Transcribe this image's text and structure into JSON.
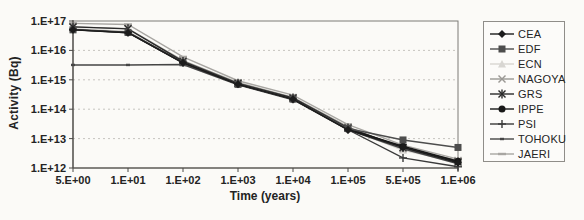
{
  "chart_data": {
    "type": "line",
    "title": "",
    "xlabel": "Time (years)",
    "ylabel": "Activity (Bq)",
    "x_axis_type": "category",
    "y_axis_type": "log",
    "ylim": [
      1000000000000.0,
      1e+17
    ],
    "grid": "horizontal-dashed",
    "legend_position": "right",
    "categories": [
      "5.E+00",
      "1.E+01",
      "1.E+02",
      "1.E+03",
      "1.E+04",
      "1.E+05",
      "5.E+05",
      "1.E+06"
    ],
    "y_tick_labels": [
      "1.E+17",
      "1.E+16",
      "1.E+15",
      "1.E+14",
      "1.E+13",
      "1.E+12"
    ],
    "series": [
      {
        "name": "JAERI",
        "marker": "dash",
        "color": "#a8a6a2",
        "values": [
          8.3e+16,
          7.6e+16,
          6000000000000000.0,
          930000000000000.0,
          300000000000000.0,
          30000000000000.0,
          6000000000000.0,
          2000000000000.0
        ]
      },
      {
        "name": "ECN",
        "marker": "triangle",
        "color": "#d8d6d2",
        "values": [
          5.5e+16,
          4.5e+16,
          4000000000000000.0,
          750000000000000.0,
          230000000000000.0,
          22000000000000.0,
          4000000000000.0,
          1600000000000.0
        ]
      },
      {
        "name": "NAGOYA",
        "marker": "x",
        "color": "#9a9894",
        "values": [
          6.3e+16,
          5.5e+16,
          4500000000000000.0,
          800000000000000.0,
          250000000000000.0,
          25000000000000.0,
          4500000000000.0,
          1800000000000.0
        ]
      },
      {
        "name": "GRS",
        "marker": "asterisk",
        "color": "#2a2a2a",
        "values": [
          6.3e+16,
          5.4e+16,
          4200000000000000.0,
          760000000000000.0,
          240000000000000.0,
          23000000000000.0,
          5000000000000.0,
          1600000000000.0
        ]
      },
      {
        "name": "PSI",
        "marker": "plus",
        "color": "#3a3a3a",
        "values": [
          5.2e+16,
          4.2e+16,
          3900000000000000.0,
          720000000000000.0,
          220000000000000.0,
          20000000000000.0,
          2200000000000.0,
          1100000000000.0
        ]
      },
      {
        "name": "TOHOKU",
        "marker": "dot",
        "color": "#454545",
        "values": [
          3200000000000000.0,
          3200000000000000.0,
          3300000000000000.0,
          680000000000000.0,
          210000000000000.0,
          20000000000000.0,
          4500000000000.0,
          1400000000000.0
        ]
      },
      {
        "name": "IPPE",
        "marker": "circle",
        "color": "#181818",
        "values": [
          5.1e+16,
          4e+16,
          3800000000000000.0,
          700000000000000.0,
          220000000000000.0,
          21000000000000.0,
          5500000000000.0,
          1700000000000.0
        ]
      },
      {
        "name": "EDF",
        "marker": "square",
        "color": "#4d4d4d",
        "values": [
          5e+16,
          4.1e+16,
          3800000000000000.0,
          700000000000000.0,
          220000000000000.0,
          22000000000000.0,
          9000000000000.0,
          5000000000000.0
        ]
      },
      {
        "name": "CEA",
        "marker": "diamond",
        "color": "#1c1c1c",
        "values": [
          5e+16,
          4e+16,
          3800000000000000.0,
          700000000000000.0,
          220000000000000.0,
          20000000000000.0,
          5000000000000.0,
          1500000000000.0
        ]
      }
    ],
    "legend_order": [
      "CEA",
      "EDF",
      "ECN",
      "NAGOYA",
      "GRS",
      "IPPE",
      "PSI",
      "TOHOKU",
      "JAERI"
    ]
  },
  "labels": {
    "y_axis_title": "Activity (Bq)",
    "x_axis_title": "Time (years)"
  }
}
